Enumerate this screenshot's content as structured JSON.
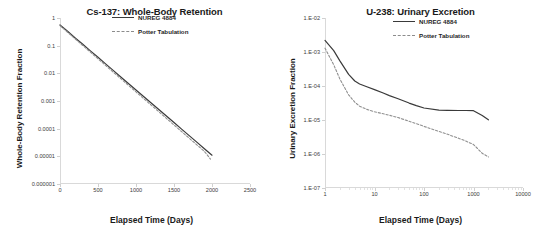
{
  "figure": {
    "panels": [
      "cs137",
      "u238"
    ]
  },
  "chart_data": [
    {
      "id": "cs137",
      "type": "line",
      "title": "Cs-137: Whole-Body Retention",
      "xlabel": "Elapsed Time (Days)",
      "ylabel": "Whole-Body Retention Fraction",
      "xscale": "linear",
      "yscale": "log",
      "xlim": [
        0,
        2500
      ],
      "ylim": [
        1e-06,
        1
      ],
      "grid": false,
      "legend_position": "top-right",
      "xticks": [
        0,
        500,
        1000,
        1500,
        2000,
        2500
      ],
      "xticklabels": [
        "0",
        "500",
        "1000",
        "1500",
        "2000",
        "2500"
      ],
      "yticks": [
        1,
        0.1,
        0.01,
        0.001,
        0.0001,
        1e-05,
        1e-06
      ],
      "yticklabels": [
        "1",
        "0.1",
        "0.01",
        "0.001",
        "0.0001",
        "0.00001",
        "0.000001"
      ],
      "series": [
        {
          "name": "NUREG 4884",
          "style": "solid",
          "color": "#3a3a3a",
          "x": [
            0,
            100,
            200,
            300,
            400,
            500,
            600,
            700,
            800,
            900,
            1000,
            1100,
            1200,
            1300,
            1400,
            1500,
            1600,
            1700,
            1800,
            1900,
            2000
          ],
          "y": [
            0.56,
            0.33,
            0.19,
            0.112,
            0.065,
            0.038,
            0.022,
            0.0128,
            0.0074,
            0.0043,
            0.0025,
            0.00145,
            0.00085,
            0.00049,
            0.000285,
            0.000166,
            9.65e-05,
            5.6e-05,
            3.26e-05,
            1.89e-05,
            1.1e-05
          ]
        },
        {
          "name": "Potter Tabulation",
          "style": "dashed",
          "color": "#909090",
          "x": [
            0,
            100,
            200,
            300,
            400,
            500,
            600,
            700,
            800,
            900,
            1000,
            1100,
            1200,
            1300,
            1400,
            1500,
            1600,
            1700,
            1800,
            1900,
            1980
          ],
          "y": [
            0.53,
            0.305,
            0.175,
            0.101,
            0.058,
            0.0335,
            0.0193,
            0.0111,
            0.0064,
            0.0037,
            0.00213,
            0.00123,
            0.00071,
            0.00041,
            0.000236,
            0.000136,
            7.85e-05,
            4.53e-05,
            2.61e-05,
            1.51e-05,
            7.95e-06
          ]
        }
      ]
    },
    {
      "id": "u238",
      "type": "line",
      "title": "U-238: Urinary Excretion",
      "xlabel": "Elapsed Time (Days)",
      "ylabel": "Urinary Excretion Fraction",
      "xscale": "log",
      "yscale": "log",
      "xlim": [
        1,
        10000
      ],
      "ylim": [
        1e-07,
        0.01
      ],
      "grid": false,
      "legend_position": "top-right",
      "xticks": [
        1,
        10,
        100,
        1000,
        10000
      ],
      "xticklabels": [
        "1",
        "10",
        "100",
        "1000",
        "10000"
      ],
      "yticks": [
        0.01,
        0.001,
        0.0001,
        1e-05,
        1e-06,
        1e-07
      ],
      "yticklabels": [
        "1.E-02",
        "1.E-03",
        "1.E-04",
        "1.E-05",
        "1.E-06",
        "1.E-07"
      ],
      "series": [
        {
          "name": "NUREG 4884",
          "style": "solid",
          "color": "#3a3a3a",
          "x": [
            1,
            1.5,
            2,
            3,
            4,
            5,
            7,
            10,
            15,
            20,
            30,
            50,
            70,
            100,
            200,
            300,
            500,
            700,
            1000,
            1500,
            2000
          ],
          "y": [
            0.0022,
            0.0011,
            0.00055,
            0.00022,
            0.00014,
            0.000115,
            9.5e-05,
            7.8e-05,
            6.2e-05,
            5.2e-05,
            4.2e-05,
            3.15e-05,
            2.65e-05,
            2.25e-05,
            1.96e-05,
            1.92e-05,
            1.9e-05,
            1.9e-05,
            1.88e-05,
            1.35e-05,
            1.01e-05
          ]
        },
        {
          "name": "Potter Tabulation",
          "style": "dashed",
          "color": "#909090",
          "x": [
            1,
            1.5,
            2,
            3,
            4,
            5,
            7,
            10,
            15,
            20,
            30,
            50,
            70,
            100,
            200,
            300,
            500,
            700,
            1000,
            1500,
            2000
          ],
          "y": [
            0.0013,
            0.00042,
            0.00016,
            5.5e-05,
            3.35e-05,
            2.55e-05,
            2.05e-05,
            1.75e-05,
            1.52e-05,
            1.38e-05,
            1.18e-05,
            9.2e-06,
            7.8e-06,
            6.5e-06,
            4.6e-06,
            3.8e-06,
            2.9e-06,
            2.4e-06,
            1.9e-06,
            1.05e-06,
            8.2e-07
          ]
        }
      ]
    }
  ]
}
